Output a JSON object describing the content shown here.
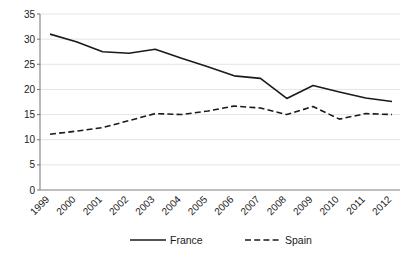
{
  "chart_data": {
    "type": "line",
    "title": "",
    "subtitle": "",
    "xlabel": "",
    "ylabel": "",
    "categories": [
      "1999",
      "2000",
      "2001",
      "2002",
      "2003",
      "2004",
      "2005",
      "2006",
      "2007",
      "2008",
      "2009",
      "2010",
      "2011",
      "2012"
    ],
    "series": [
      {
        "name": "France",
        "style": "solid",
        "color": "#1a1a1a",
        "values": [
          31.0,
          29.5,
          27.5,
          27.2,
          28.0,
          26.2,
          24.5,
          22.7,
          22.2,
          18.2,
          20.8,
          19.5,
          18.3,
          17.6
        ]
      },
      {
        "name": "Spain",
        "style": "dashed",
        "color": "#1a1a1a",
        "values": [
          11.1,
          11.7,
          12.4,
          13.8,
          15.2,
          15.0,
          15.7,
          16.7,
          16.3,
          15.0,
          16.6,
          14.1,
          15.2,
          15.0
        ]
      }
    ],
    "ylim": [
      0,
      35
    ],
    "yticks": [
      0,
      5,
      10,
      15,
      20,
      25,
      30,
      35
    ],
    "ytick_labels": [
      "0",
      "5",
      "10",
      "15",
      "20",
      "25",
      "30",
      "35"
    ],
    "grid": true,
    "grid_axis": "y",
    "legend_position": "bottom",
    "legend_entries": [
      "France",
      "Spain"
    ]
  },
  "axes": {
    "y_ticks": [
      "0",
      "5",
      "10",
      "15",
      "20",
      "25",
      "30",
      "35"
    ],
    "x_ticks": [
      "1999",
      "2000",
      "2001",
      "2002",
      "2003",
      "2004",
      "2005",
      "2006",
      "2007",
      "2008",
      "2009",
      "2010",
      "2011",
      "2012"
    ]
  },
  "legend": {
    "items": [
      {
        "label": "France",
        "style": "solid"
      },
      {
        "label": "Spain",
        "style": "dashed"
      }
    ]
  },
  "colors": {
    "series": "#1a1a1a",
    "gridline": "#d9d9d9",
    "axis": "#7f7f7f",
    "background": "#ffffff"
  }
}
